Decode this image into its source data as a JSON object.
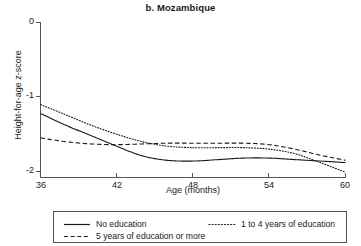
{
  "chart_data": {
    "type": "line",
    "title": "b. Mozambique",
    "xlabel": "Age (months)",
    "ylabel": "Height-for-age z-score",
    "xlim": [
      36,
      60
    ],
    "ylim": [
      -2.25,
      0
    ],
    "xticks": [
      36,
      42,
      48,
      54,
      60
    ],
    "yticks": [
      0,
      -1,
      -2
    ],
    "xtick_labels": [
      "36",
      "42",
      "48",
      "54",
      "60"
    ],
    "ytick_labels": [
      "0",
      "-1",
      "-2"
    ],
    "grid": false,
    "legend_position": "bottom",
    "x": [
      36,
      38,
      40,
      42,
      44,
      46,
      48,
      50,
      52,
      54,
      56,
      58,
      60
    ],
    "series": [
      {
        "name": "No education",
        "style": "solid",
        "values": [
          -1.22,
          -1.38,
          -1.52,
          -1.66,
          -1.79,
          -1.85,
          -1.86,
          -1.84,
          -1.82,
          -1.82,
          -1.84,
          -1.86,
          -1.88
        ]
      },
      {
        "name": "1 to 4 years of education",
        "style": "dotted",
        "values": [
          -1.1,
          -1.24,
          -1.38,
          -1.5,
          -1.6,
          -1.66,
          -1.68,
          -1.68,
          -1.68,
          -1.7,
          -1.76,
          -1.88,
          -2.01
        ]
      },
      {
        "name": "5 years of education or more",
        "style": "dashed",
        "values": [
          -1.55,
          -1.6,
          -1.63,
          -1.64,
          -1.63,
          -1.62,
          -1.62,
          -1.62,
          -1.62,
          -1.64,
          -1.7,
          -1.78,
          -1.85
        ]
      }
    ]
  },
  "legend": {
    "items": [
      {
        "label": "No education",
        "style": "solid"
      },
      {
        "label": "1 to 4 years of education",
        "style": "dotted"
      },
      {
        "label": "5 years of education or more",
        "style": "dashed"
      }
    ]
  },
  "colors": {
    "line": "#1a1a1a",
    "axis": "#555555",
    "background": "#ffffff"
  }
}
